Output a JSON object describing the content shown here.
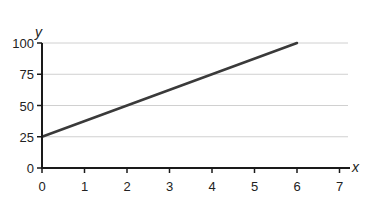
{
  "chart_data": {
    "type": "line",
    "title": "",
    "xlabel": "x",
    "ylabel": "y",
    "xlim": [
      0,
      7
    ],
    "ylim": [
      0,
      100
    ],
    "x_ticks": [
      0,
      1,
      2,
      3,
      4,
      5,
      6,
      7
    ],
    "y_ticks": [
      0,
      25,
      50,
      75,
      100
    ],
    "grid": {
      "horizontal": true,
      "vertical": false
    },
    "legend": null,
    "series": [
      {
        "name": "line",
        "x": [
          0,
          6
        ],
        "y": [
          25,
          100
        ],
        "color": "#3a3a3a"
      }
    ]
  },
  "style": {
    "axis_color": "#1a1a1a",
    "grid_color": "#d0d0d0",
    "line_color": "#3a3a3a"
  }
}
